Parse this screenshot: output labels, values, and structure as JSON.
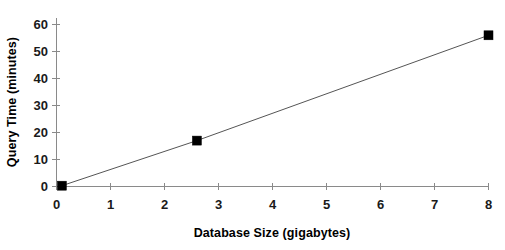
{
  "chart_data": {
    "type": "line",
    "title": "",
    "subtitle": "",
    "xlabel": "Database Size (gigabytes)",
    "ylabel": "Query Time (minutes)",
    "xlim": [
      0,
      8
    ],
    "ylim": [
      0,
      60
    ],
    "xticks": [
      0,
      1,
      2,
      3,
      4,
      5,
      6,
      7,
      8
    ],
    "yticks": [
      0,
      10,
      20,
      30,
      40,
      50,
      60
    ],
    "xtick_labels": [
      "0",
      "1",
      "2",
      "3",
      "4",
      "5",
      "6",
      "7",
      "8"
    ],
    "ytick_labels": [
      "0",
      "10",
      "20",
      "30",
      "40",
      "50",
      "60"
    ],
    "grid": false,
    "legend": "none",
    "marker": "square",
    "marker_color": "#000000",
    "line_color": "#555555",
    "background_color": "#ffffff",
    "series": [
      {
        "name": "Query Time",
        "x": [
          0.1,
          2.6,
          8.0
        ],
        "y": [
          0.3,
          17,
          56
        ],
        "points": [
          {
            "x": 0.1,
            "y": 0.3
          },
          {
            "x": 2.6,
            "y": 17
          },
          {
            "x": 8.0,
            "y": 56
          }
        ]
      }
    ],
    "annotations": []
  }
}
